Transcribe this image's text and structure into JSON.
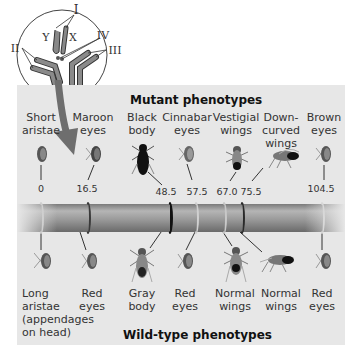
{
  "figure": {
    "inset": {
      "chromosome_labels": [
        "I",
        "II",
        "III",
        "IV",
        "X",
        "Y"
      ]
    },
    "mutant_heading": "Mutant phenotypes",
    "wildtype_heading": "Wild-type phenotypes",
    "loci": [
      {
        "position": "0",
        "mutant": [
          "Short",
          "aristae"
        ],
        "wildtype": [
          "Long",
          "aristae",
          "(appendages",
          "on head)"
        ],
        "band_color": "#c9c9c9"
      },
      {
        "position": "16.5",
        "mutant": [
          "Maroon",
          "eyes"
        ],
        "wildtype": [
          "Red",
          "eyes"
        ],
        "band_color": "#3a3a3a"
      },
      {
        "position": "48.5",
        "mutant": [
          "Black",
          "body"
        ],
        "wildtype": [
          "Gray",
          "body"
        ],
        "band_color": "#111111"
      },
      {
        "position": "57.5",
        "mutant": [
          "Cinnabar",
          "eyes"
        ],
        "wildtype": [
          "Red",
          "eyes"
        ],
        "band_color": "#cfcfcf"
      },
      {
        "position": "67.0",
        "mutant": [
          "Vestigial",
          "wings"
        ],
        "wildtype": [
          "Normal",
          "wings"
        ],
        "band_color": "#c5c5c5"
      },
      {
        "position": "75.5",
        "mutant": [
          "Down-",
          "curved",
          "wings"
        ],
        "wildtype": [
          "Normal",
          "wings"
        ],
        "band_color": "#2a2a2a"
      },
      {
        "position": "104.5",
        "mutant": [
          "Brown",
          "eyes"
        ],
        "wildtype": [
          "Red",
          "eyes"
        ],
        "band_color": "#d6d6d6"
      }
    ],
    "colors": {
      "panel": "#e7e7e7",
      "chromosome": "#9a9a9a",
      "arrow": "#6e6e6e"
    }
  }
}
